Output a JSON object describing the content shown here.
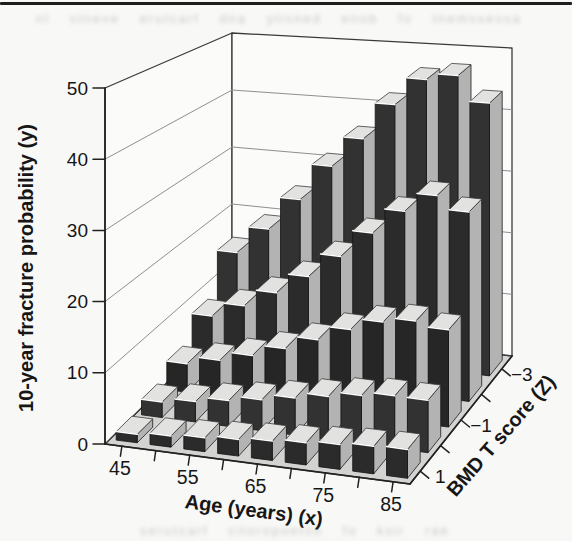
{
  "page": {
    "ghost_top": "nl stneve erutcarf dna ytisned enob fo tnemssessa eht ni",
    "ghost_bottom": "serutcarf citoropoetso fo ksir raey net"
  },
  "colors": {
    "page_rule": "#1e1e1e",
    "bar_front": "#2b2b2b",
    "bar_side": "#b3b3b3",
    "bar_top": "#e2e2e1",
    "floor": "#d3d3d2",
    "wall": "#fbfbfa",
    "gridline": "#8f8f8f",
    "edge": "#3a3a3a",
    "axis": "#222222"
  },
  "chart_data": {
    "type": "bar",
    "projection": "3d",
    "title": "",
    "xlabel": "Age (years) (x)",
    "ylabel": "10-year fracture probability (y)",
    "zlabel": "BMD T score (Z)",
    "categories_x": [
      45,
      50,
      55,
      60,
      65,
      70,
      75,
      80,
      85
    ],
    "x_major_ticks": [
      45,
      55,
      65,
      75,
      85
    ],
    "ylim": [
      0,
      50
    ],
    "y_tick_step": 10,
    "y_tick_labels": [
      "0",
      "10",
      "20",
      "30",
      "40",
      "50"
    ],
    "z_categories_front_to_back": [
      "1",
      "0",
      "-1",
      "-2",
      "-3"
    ],
    "z_major_tick_labels": [
      "1",
      "−1",
      "−3"
    ],
    "grid": true,
    "legend": "none",
    "series": [
      {
        "name": "1",
        "values": [
          1.2,
          1.6,
          2.0,
          2.4,
          2.8,
          3.2,
          3.6,
          4.0,
          4.2
        ]
      },
      {
        "name": "0",
        "values": [
          2.3,
          3.0,
          3.8,
          4.6,
          5.5,
          6.4,
          7.2,
          7.8,
          7.8
        ]
      },
      {
        "name": "-1",
        "values": [
          4.4,
          5.6,
          7.0,
          8.7,
          10.7,
          12.9,
          14.7,
          15.5,
          14.8
        ]
      },
      {
        "name": "-2",
        "values": [
          8.2,
          10.5,
          13.2,
          16.4,
          20.2,
          24.5,
          28.5,
          31.5,
          29.5
        ]
      },
      {
        "name": "-3",
        "values": [
          15.0,
          19.5,
          25.0,
          31.0,
          36.0,
          42.0,
          46.5,
          47.5,
          43.5
        ]
      }
    ]
  }
}
